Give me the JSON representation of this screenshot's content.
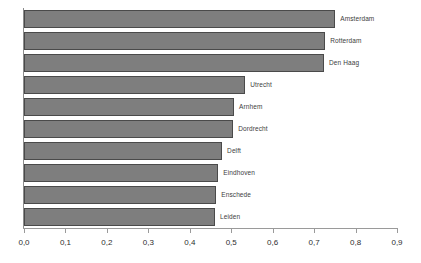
{
  "chart_data": {
    "type": "bar",
    "orientation": "horizontal",
    "title": "",
    "xlabel": "",
    "ylabel": "",
    "xlim": [
      0.0,
      0.9
    ],
    "grid": false,
    "legend": "none",
    "decimal_separator": ",",
    "xticks": [
      "0,0",
      "0,1",
      "0,2",
      "0,3",
      "0,4",
      "0,5",
      "0,6",
      "0,7",
      "0,8",
      "0,9"
    ],
    "xtick_values": [
      0.0,
      0.1,
      0.2,
      0.3,
      0.4,
      0.5,
      0.6,
      0.7,
      0.8,
      0.9
    ],
    "categories": [
      "Amsterdam",
      "Rotterdam",
      "Den Haag",
      "Utrecht",
      "Arnhem",
      "Dordrecht",
      "Delft",
      "Eindhoven",
      "Enschede",
      "Leiden"
    ],
    "values": [
      0.751,
      0.727,
      0.724,
      0.534,
      0.507,
      0.505,
      0.478,
      0.469,
      0.464,
      0.461
    ],
    "bar_color": "#7e7e7e",
    "bar_border_color": "#4a4a4a",
    "axis_color": "#9a9a9a",
    "label_color": "#3d3d3d",
    "background": "#ffffff"
  }
}
